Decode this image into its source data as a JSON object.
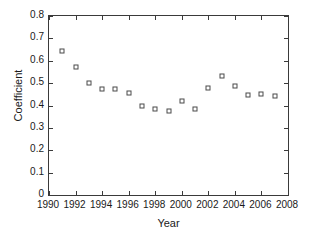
{
  "chart_data": {
    "type": "scatter",
    "title": "",
    "xlabel": "Year",
    "ylabel": "Coefficient",
    "xlim": [
      1990,
      2008
    ],
    "ylim": [
      0,
      0.8
    ],
    "grid": false,
    "legend": null,
    "marker": "open-square",
    "marker_color": "#4a4a4a",
    "xticks": [
      1990,
      1992,
      1994,
      1996,
      1998,
      2000,
      2002,
      2004,
      2006,
      2008
    ],
    "xtick_labels": [
      "1990",
      "1992",
      "1994",
      "1996",
      "1998",
      "2000",
      "2002",
      "2004",
      "2006",
      "2008"
    ],
    "yticks": [
      0,
      0.1,
      0.2,
      0.3,
      0.4,
      0.5,
      0.6,
      0.7,
      0.8
    ],
    "ytick_labels": [
      "0",
      "0.1",
      "0.2",
      "0.3",
      "0.4",
      "0.5",
      "0.6",
      "0.7",
      "0.8"
    ],
    "x": [
      1991,
      1992,
      1993,
      1994,
      1995,
      1996,
      1997,
      1998,
      1999,
      2000,
      2001,
      2002,
      2003,
      2004,
      2005,
      2006,
      2007
    ],
    "y": [
      0.645,
      0.573,
      0.5,
      0.473,
      0.473,
      0.456,
      0.396,
      0.386,
      0.374,
      0.42,
      0.386,
      0.477,
      0.533,
      0.489,
      0.448,
      0.45,
      0.441
    ],
    "points": [
      {
        "year": 1991,
        "value": 0.645
      },
      {
        "year": 1992,
        "value": 0.573
      },
      {
        "year": 1993,
        "value": 0.5
      },
      {
        "year": 1994,
        "value": 0.473
      },
      {
        "year": 1995,
        "value": 0.473
      },
      {
        "year": 1996,
        "value": 0.456
      },
      {
        "year": 1997,
        "value": 0.396
      },
      {
        "year": 1998,
        "value": 0.386
      },
      {
        "year": 1999,
        "value": 0.374
      },
      {
        "year": 2000,
        "value": 0.42
      },
      {
        "year": 2001,
        "value": 0.386
      },
      {
        "year": 2002,
        "value": 0.477
      },
      {
        "year": 2003,
        "value": 0.533
      },
      {
        "year": 2004,
        "value": 0.489
      },
      {
        "year": 2005,
        "value": 0.448
      },
      {
        "year": 2006,
        "value": 0.45
      },
      {
        "year": 2007,
        "value": 0.441
      }
    ]
  }
}
